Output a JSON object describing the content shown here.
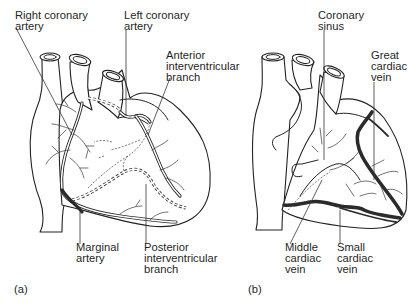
{
  "figure": {
    "panels": [
      {
        "id": "a",
        "caption": "(a)",
        "subject": "Coronary arteries (anterior view)",
        "labels": [
          {
            "key": "right_coronary_artery",
            "lines": [
              "Right coronary",
              "artery"
            ]
          },
          {
            "key": "left_coronary_artery",
            "lines": [
              "Left coronary",
              "artery"
            ]
          },
          {
            "key": "anterior_interventricular_branch",
            "lines": [
              "Anterior",
              "interventricular",
              "branch"
            ]
          },
          {
            "key": "marginal_artery",
            "lines": [
              "Marginal",
              "artery"
            ]
          },
          {
            "key": "posterior_interventricular_branch",
            "lines": [
              "Posterior",
              "interventricular",
              "branch"
            ]
          }
        ]
      },
      {
        "id": "b",
        "caption": "(b)",
        "subject": "Cardiac veins (anterior view)",
        "labels": [
          {
            "key": "coronary_sinus",
            "lines": [
              "Coronary",
              "sinus"
            ]
          },
          {
            "key": "great_cardiac_vein",
            "lines": [
              "Great",
              "cardiac",
              "vein"
            ]
          },
          {
            "key": "middle_cardiac_vein",
            "lines": [
              "Middle",
              "cardiac",
              "vein"
            ]
          },
          {
            "key": "small_cardiac_vein",
            "lines": [
              "Small",
              "cardiac",
              "vein"
            ]
          }
        ]
      }
    ]
  },
  "text": {
    "a_rca": "Right coronary\nartery",
    "a_lca": "Left coronary\nartery",
    "a_aib": "Anterior\ninterventricular\nbranch",
    "a_marg": "Marginal\nartery",
    "a_pib": "Posterior\ninterventricular\nbranch",
    "a_cap": "(a)",
    "b_cs": "Coronary\nsinus",
    "b_gcv": "Great\ncardiac\nvein",
    "b_mcv": "Middle\ncardiac\nvein",
    "b_scv": "Small\ncardiac\nvein",
    "b_cap": "(b)"
  }
}
